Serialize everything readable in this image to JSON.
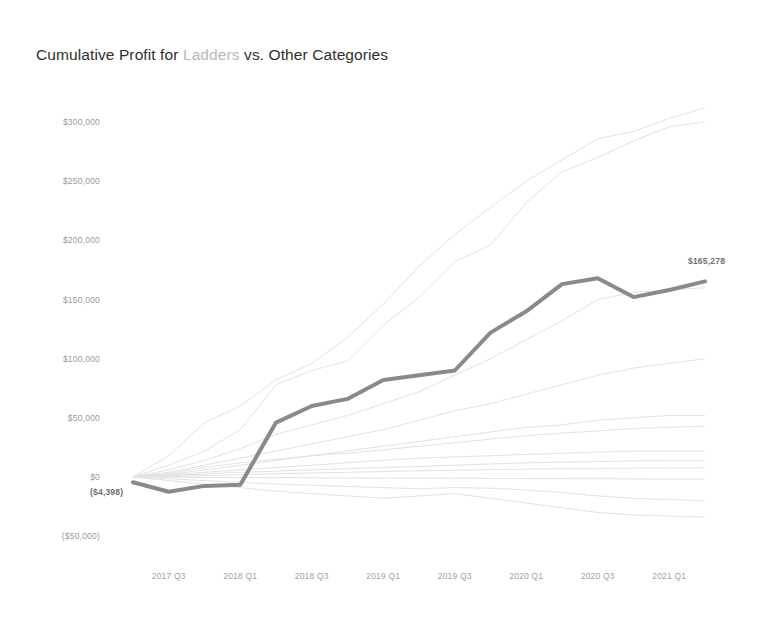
{
  "title": {
    "prefix": "Cumulative Profit for ",
    "highlight": "Ladders",
    "suffix": " vs. Other Categories"
  },
  "annotations": {
    "end_value_label": "$165,278",
    "start_value_label": "($4,398)"
  },
  "colors": {
    "highlight_line": "#8a8a8a",
    "other_lines": "#e2e2e2",
    "title_text": "#2f2f2f",
    "title_highlight": "#b9b9b9",
    "axis_text": "#9a9a9a"
  },
  "chart_data": {
    "type": "line",
    "title": "Cumulative Profit for Ladders vs. Other Categories",
    "xlabel": "",
    "ylabel": "",
    "grid": false,
    "legend": "none",
    "ylim": [
      -60000,
      320000
    ],
    "yticks": [
      300000,
      250000,
      200000,
      150000,
      100000,
      50000,
      0,
      -50000
    ],
    "ytick_labels": [
      "$300,000",
      "$250,000",
      "$200,000",
      "$150,000",
      "$100,000",
      "$50,000",
      "$0",
      "($50,000)"
    ],
    "x": [
      "2017 Q2",
      "2017 Q3",
      "2017 Q4",
      "2018 Q1",
      "2018 Q2",
      "2018 Q3",
      "2018 Q4",
      "2019 Q1",
      "2019 Q2",
      "2019 Q3",
      "2019 Q4",
      "2020 Q1",
      "2020 Q2",
      "2020 Q3",
      "2020 Q4",
      "2021 Q1",
      "2021 Q2"
    ],
    "xtick_labels": [
      "2017 Q3",
      "2018 Q1",
      "2018 Q3",
      "2019 Q1",
      "2019 Q3",
      "2020 Q1",
      "2020 Q3",
      "2021 Q1"
    ],
    "highlight_series": {
      "name": "Ladders",
      "values": [
        -4398,
        -12500,
        -7500,
        -6500,
        46000,
        60000,
        66000,
        82000,
        86000,
        90000,
        122000,
        140000,
        163000,
        168000,
        152000,
        158000,
        165278
      ]
    },
    "series": [
      {
        "name": "Category A",
        "values": [
          0,
          18000,
          46000,
          60000,
          82000,
          96000,
          118000,
          146000,
          178000,
          205000,
          228000,
          250000,
          268000,
          286000,
          292000,
          303000,
          312000
        ]
      },
      {
        "name": "Category B",
        "values": [
          0,
          10000,
          22000,
          40000,
          78000,
          90000,
          98000,
          128000,
          152000,
          182000,
          196000,
          232000,
          258000,
          270000,
          284000,
          296000,
          300000
        ]
      },
      {
        "name": "Category C",
        "values": [
          0,
          6000,
          14000,
          24000,
          36000,
          44000,
          52000,
          62000,
          72000,
          86000,
          100000,
          116000,
          132000,
          150000,
          156000,
          158000,
          160000
        ]
      },
      {
        "name": "Category D",
        "values": [
          0,
          4000,
          10000,
          16000,
          22000,
          28000,
          34000,
          40000,
          48000,
          56000,
          62000,
          70000,
          78000,
          86000,
          92000,
          96000,
          100000
        ]
      },
      {
        "name": "Category E",
        "values": [
          0,
          2000,
          6000,
          10000,
          14000,
          18000,
          22000,
          26000,
          30000,
          34000,
          38000,
          42000,
          44000,
          48000,
          50000,
          52000,
          52000
        ]
      },
      {
        "name": "Category F",
        "values": [
          0,
          1500,
          4000,
          6000,
          8000,
          10000,
          12000,
          14000,
          16000,
          17000,
          18000,
          19000,
          20000,
          21000,
          22000,
          22000,
          22000
        ]
      },
      {
        "name": "Category G",
        "values": [
          0,
          1000,
          2500,
          4000,
          5000,
          6000,
          7000,
          8000,
          9000,
          10000,
          11000,
          12000,
          12500,
          13000,
          13500,
          14000,
          14000
        ]
      },
      {
        "name": "Category H",
        "values": [
          0,
          500,
          1200,
          2000,
          2800,
          3400,
          4000,
          4600,
          5200,
          5800,
          6200,
          6600,
          7000,
          7200,
          7400,
          7600,
          7800
        ]
      },
      {
        "name": "Category I",
        "values": [
          0,
          -200,
          -400,
          -500,
          -600,
          -700,
          -800,
          -900,
          -1000,
          -1100,
          -1200,
          -1300,
          -1400,
          -1500,
          -1600,
          -1700,
          -1800
        ]
      },
      {
        "name": "Category J",
        "values": [
          0,
          -1500,
          -3000,
          -4500,
          -6000,
          -7000,
          -8000,
          -9000,
          -10000,
          -9000,
          -9500,
          -11000,
          -13000,
          -16000,
          -18000,
          -19000,
          -20000
        ]
      },
      {
        "name": "Category K",
        "values": [
          0,
          -3000,
          -6000,
          -9000,
          -12000,
          -14000,
          -16000,
          -18000,
          -16000,
          -14000,
          -18000,
          -22000,
          -26000,
          -30000,
          -32000,
          -33000,
          -34000
        ]
      },
      {
        "name": "Category L",
        "values": [
          0,
          3000,
          8000,
          12000,
          15000,
          18000,
          20000,
          23000,
          26000,
          29000,
          32000,
          35000,
          37000,
          39000,
          41000,
          42000,
          43000
        ]
      }
    ]
  }
}
